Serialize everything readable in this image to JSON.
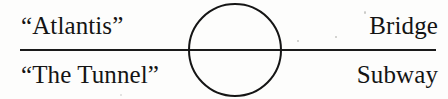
{
  "figure": {
    "type": "venn-axis-diagram",
    "background_color": "#fdfdfc",
    "ink_color": "#151515",
    "axis": {
      "orientation": "horizontal",
      "stroke_color": "#1a1a1a",
      "thickness_px": 2
    },
    "circle": {
      "shape": "circle",
      "stroke_color": "#151515",
      "fill": "none",
      "thickness_px": 2,
      "position": "centered-on-axis"
    },
    "labels": {
      "top_left": "“Atlantis”",
      "bottom_left": "“The Tunnel”",
      "top_right": "Bridge",
      "bottom_right": "Subway"
    }
  }
}
